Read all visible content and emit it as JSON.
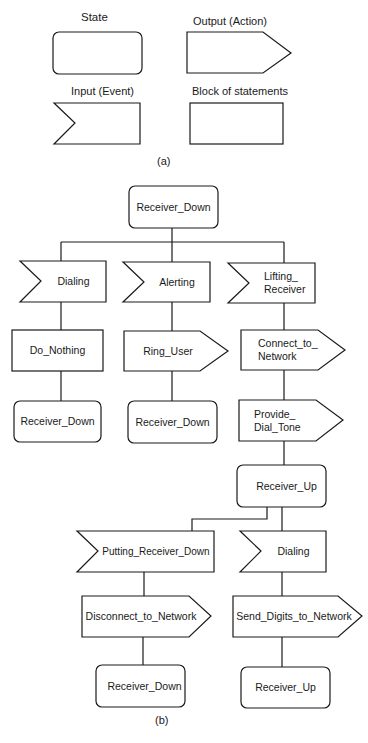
{
  "legend": {
    "state_label": "State",
    "output_label": "Output (Action)",
    "input_label": "Input (Event)",
    "block_label": "Block of statements",
    "caption": "(a)"
  },
  "diagram": {
    "caption": "(b)",
    "root_state": "Receiver_Down",
    "branches": [
      {
        "input": "Dialing",
        "action": "Do_Nothing",
        "action_type": "block",
        "next_state": "Receiver_Down"
      },
      {
        "input": "Alerting",
        "action": "Ring_User",
        "action_type": "output",
        "next_state": "Receiver_Down"
      },
      {
        "input_line1": "Lifting_",
        "input_line2": "Receiver",
        "output1_line1": "Connect_to_",
        "output1_line2": "Network",
        "output2_line1": "Provide_",
        "output2_line2": "Dial_Tone",
        "next_state": "Receiver_Up"
      }
    ],
    "sub_branches": [
      {
        "input": "Putting_Receiver_Down",
        "action": "Disconnect_to_Network",
        "action_type": "output",
        "next_state": "Receiver_Down"
      },
      {
        "input": "Dialing",
        "action": "Send_Digits_to_Network",
        "action_type": "output",
        "next_state": "Receiver_Up"
      }
    ]
  },
  "colors": {
    "stroke": "#1a1a1a",
    "background": "#ffffff"
  }
}
